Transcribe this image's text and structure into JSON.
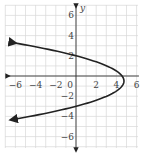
{
  "chart_data": {
    "type": "line",
    "title": "",
    "xlabel": "",
    "ylabel": "y",
    "xlim": [
      -6.5,
      6.5
    ],
    "ylim": [
      -7,
      7
    ],
    "grid": true,
    "x_ticks": [
      "-6",
      "-4",
      "-2",
      "0",
      "2",
      "4",
      "6"
    ],
    "y_ticks": [
      "6",
      "4",
      "2",
      "-2",
      "-4",
      "-6"
    ],
    "series": [
      {
        "name": "parabola opening left",
        "equation_hint": "x = -0.76(y-2)(y+3)",
        "vertex": [
          4.75,
          -0.5
        ],
        "y_intercepts": [
          2,
          -3
        ],
        "endpoints_arrows": [
          [
            -6,
            3.3
          ],
          [
            -6,
            -4.3
          ]
        ]
      }
    ],
    "colors": {
      "curve": "#222222",
      "grid": "#d8d8d8",
      "axis": "#333333"
    }
  }
}
